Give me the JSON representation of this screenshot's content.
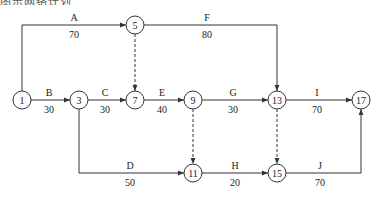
{
  "caption": "图示网络计划",
  "nodes": [
    {
      "id": "1",
      "x": 22,
      "y": 100
    },
    {
      "id": "3",
      "x": 79,
      "y": 100
    },
    {
      "id": "5",
      "x": 135,
      "y": 25
    },
    {
      "id": "7",
      "x": 135,
      "y": 100
    },
    {
      "id": "9",
      "x": 193,
      "y": 100
    },
    {
      "id": "11",
      "x": 193,
      "y": 173
    },
    {
      "id": "13",
      "x": 277,
      "y": 100
    },
    {
      "id": "15",
      "x": 277,
      "y": 173
    },
    {
      "id": "17",
      "x": 361,
      "y": 100
    }
  ],
  "activities": [
    {
      "name": "A",
      "duration": "70",
      "from": "1",
      "to": "5"
    },
    {
      "name": "B",
      "duration": "30",
      "from": "1",
      "to": "3"
    },
    {
      "name": "C",
      "duration": "30",
      "from": "3",
      "to": "7"
    },
    {
      "name": "D",
      "duration": "50",
      "from": "3",
      "to": "11"
    },
    {
      "name": "E",
      "duration": "40",
      "from": "7",
      "to": "9"
    },
    {
      "name": "F",
      "duration": "80",
      "from": "5",
      "to": "13"
    },
    {
      "name": "G",
      "duration": "30",
      "from": "9",
      "to": "13"
    },
    {
      "name": "H",
      "duration": "20",
      "from": "11",
      "to": "15"
    },
    {
      "name": "I",
      "duration": "70",
      "from": "13",
      "to": "17"
    },
    {
      "name": "J",
      "duration": "70",
      "from": "15",
      "to": "17"
    }
  ],
  "dummy_activities": [
    {
      "from": "5",
      "to": "7"
    },
    {
      "from": "9",
      "to": "11"
    },
    {
      "from": "13",
      "to": "15"
    }
  ]
}
